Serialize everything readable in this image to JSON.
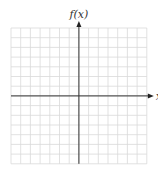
{
  "chart_data": {
    "type": "line",
    "title": "",
    "xlabel": "x",
    "ylabel": "f(x)",
    "grid": true,
    "xlim": [
      -7,
      7
    ],
    "ylim": [
      -7,
      7
    ],
    "series": []
  },
  "axes": {
    "x_label": "x",
    "y_label": "f(x)"
  },
  "colors": {
    "grid": "#d9d9d9",
    "axis": "#333333",
    "background": "#ffffff"
  },
  "grid": {
    "left": 11,
    "top": 28,
    "cell": 9.7,
    "cols": 14,
    "rows": 14,
    "origin_col": 7,
    "origin_row": 7
  }
}
